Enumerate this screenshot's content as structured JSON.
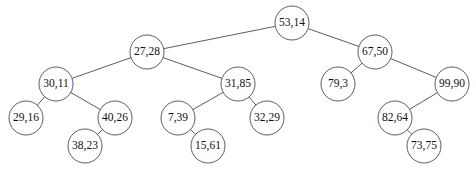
{
  "diagram": {
    "width": 476,
    "height": 179,
    "background_color": "#ffffff",
    "node_color": "#ffffff",
    "stroke_color": "#4a4a4a",
    "text_color": "#111111",
    "node_radius": 17,
    "nodes": [
      {
        "id": "n53",
        "label": "53,14",
        "cx": 292,
        "cy": 23,
        "radius": 17
      },
      {
        "id": "n27",
        "label": "27,28",
        "cx": 147,
        "cy": 52,
        "radius": 17
      },
      {
        "id": "n67",
        "label": "67,50",
        "cx": 375,
        "cy": 52,
        "radius": 17
      },
      {
        "id": "n30",
        "label": "30,11",
        "cx": 56,
        "cy": 84,
        "radius": 17
      },
      {
        "id": "n31",
        "label": "31,85",
        "cx": 238,
        "cy": 84,
        "radius": 17
      },
      {
        "id": "n79",
        "label": "79,3",
        "cx": 338,
        "cy": 84,
        "radius": 17
      },
      {
        "id": "n99",
        "label": "99,90",
        "cx": 452,
        "cy": 84,
        "radius": 17
      },
      {
        "id": "n29",
        "label": "29,16",
        "cx": 26,
        "cy": 118,
        "radius": 17
      },
      {
        "id": "n40",
        "label": "40,26",
        "cx": 115,
        "cy": 118,
        "radius": 17
      },
      {
        "id": "n7",
        "label": "7,39",
        "cx": 178,
        "cy": 118,
        "radius": 17
      },
      {
        "id": "n32",
        "label": "32,29",
        "cx": 267,
        "cy": 118,
        "radius": 17
      },
      {
        "id": "n82",
        "label": "82,64",
        "cx": 395,
        "cy": 118,
        "radius": 17
      },
      {
        "id": "n38",
        "label": "38,23",
        "cx": 85,
        "cy": 146,
        "radius": 17
      },
      {
        "id": "n15",
        "label": "15,61",
        "cx": 208,
        "cy": 146,
        "radius": 17
      },
      {
        "id": "n73",
        "label": "73,75",
        "cx": 424,
        "cy": 146,
        "radius": 17
      }
    ],
    "edges": [
      {
        "id": "e1",
        "from": "n53",
        "to": "n27"
      },
      {
        "id": "e2",
        "from": "n53",
        "to": "n67"
      },
      {
        "id": "e3",
        "from": "n27",
        "to": "n30"
      },
      {
        "id": "e4",
        "from": "n27",
        "to": "n31"
      },
      {
        "id": "e5",
        "from": "n67",
        "to": "n79"
      },
      {
        "id": "e6",
        "from": "n67",
        "to": "n99"
      },
      {
        "id": "e7",
        "from": "n30",
        "to": "n29"
      },
      {
        "id": "e8",
        "from": "n30",
        "to": "n40"
      },
      {
        "id": "e9",
        "from": "n31",
        "to": "n7"
      },
      {
        "id": "e10",
        "from": "n31",
        "to": "n32"
      },
      {
        "id": "e11",
        "from": "n40",
        "to": "n38"
      },
      {
        "id": "e12",
        "from": "n7",
        "to": "n15"
      },
      {
        "id": "e13",
        "from": "n99",
        "to": "n82"
      },
      {
        "id": "e14",
        "from": "n82",
        "to": "n73"
      }
    ]
  }
}
